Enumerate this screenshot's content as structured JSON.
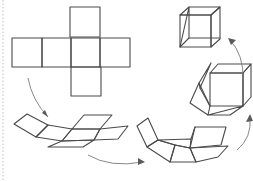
{
  "diagram": {
    "colors": {
      "edge": "#4a4a4a",
      "arrow": "#7a7a7a",
      "background": "#ffffff",
      "margin_line": "#c8c8c8"
    },
    "margin_line": {
      "x": 3,
      "y1": 0,
      "y2": 181
    },
    "stages": [
      {
        "name": "flat-cross-net",
        "polygons": [
          "70,7 100,7 100,37 70,37",
          "12,38 42,38 42,67 12,67",
          "42,38 71,38 71,67 42,67",
          "71,38 100,38 100,67 71,67",
          "100,38 130,38 130,67 100,67",
          "71,67 101,67 101,96 71,96"
        ]
      },
      {
        "name": "partially-folded-net",
        "polygons": [
          "14,124 27,114 48,125 36,137",
          "48,125 72,129 62,141 36,137",
          "72,129 84,115 112,115 100,129",
          "72,129 100,129 94,140 62,141",
          "100,129 128,126 118,139 94,140",
          "62,141 94,140 83,147 48,147"
        ]
      },
      {
        "name": "mostly-folded-net",
        "polygons": [
          "137,126 148,118 158,140 147,147",
          "147,147 158,140 175,145 170,162",
          "158,140 191,139 190,148 175,145",
          "175,145 190,148 196,162 170,162",
          "190,148 228,146 218,157 196,162",
          "190,148 195,127 226,127 221,145",
          "191,139 195,127"
        ]
      },
      {
        "name": "almost-cube",
        "polygons": [
          "210,73 243,73 243,106 210,106",
          "210,73 218,64 251,64 243,73",
          "243,73 251,64 251,97 243,106",
          "190,103 208,115 210,106 199,83",
          "199,83 211,63 200,88",
          "200,88 210,106",
          "208,115 230,115 243,106"
        ]
      },
      {
        "name": "finished-cube",
        "polygons": [
          "180,15 211,15 211,47 180,47",
          "180,15 189,7 220,7 211,15",
          "211,15 220,7 220,39 211,47",
          "189,7 189,38 180,47",
          "189,38 220,38"
        ]
      }
    ],
    "arrows": [
      {
        "name": "arrow-net-to-stage2",
        "path": "M28,78 Q32,100 48,117",
        "head": "48,117 42,113 45,110"
      },
      {
        "name": "arrow-stage2-to-stage3",
        "path": "M88,155 Q110,168 143,162",
        "head": "145,162 138,158 138,165"
      },
      {
        "name": "arrow-stage3-to-stage4",
        "path": "M237,150 Q252,138 250,117",
        "head": "250,114 246,122 253,121"
      },
      {
        "name": "arrow-stage4-to-cube",
        "path": "M243,80 Q244,55 230,40",
        "head": "228,38 236,40 231,45"
      }
    ]
  }
}
